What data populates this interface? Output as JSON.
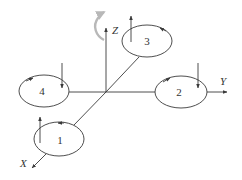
{
  "diagram": {
    "type": "quadrotor-frame",
    "axes": [
      {
        "id": "x",
        "label": "X"
      },
      {
        "id": "y",
        "label": "Y"
      },
      {
        "id": "z",
        "label": "Z"
      }
    ],
    "rotors": [
      {
        "id": "1",
        "label": "1",
        "spin": "counter-clockwise",
        "thrust": "up"
      },
      {
        "id": "2",
        "label": "2",
        "spin": "clockwise",
        "thrust": "down"
      },
      {
        "id": "3",
        "label": "3",
        "spin": "counter-clockwise",
        "thrust": "up"
      },
      {
        "id": "4",
        "label": "4",
        "spin": "clockwise",
        "thrust": "down"
      }
    ],
    "yaw_indicator": {
      "color": "#b8b8b8"
    },
    "colors": {
      "line": "#3a3a3a",
      "yaw_arrow": "#b8b8b8",
      "background": "#ffffff"
    }
  }
}
